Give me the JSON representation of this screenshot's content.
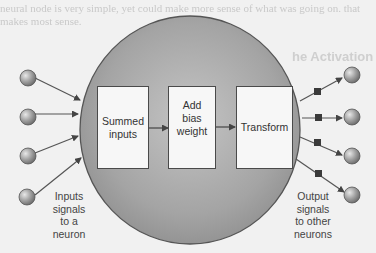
{
  "background_text": {
    "line1": "neural node is very simple, yet could make more sense of what was going on. that",
    "line2": "makes most sense.",
    "heading": "he Activation"
  },
  "neuron": {
    "fill_color": "#a6a6a6",
    "stroke_color": "#555555",
    "stages": [
      {
        "id": "summed",
        "lines": [
          "Summed",
          "inputs"
        ]
      },
      {
        "id": "bias",
        "lines": [
          "Add",
          "bias",
          "weight"
        ]
      },
      {
        "id": "transform",
        "lines": [
          "Transform"
        ]
      }
    ]
  },
  "inputs": {
    "count": 4,
    "caption_lines": [
      "Inputs",
      "signals",
      "to a",
      "neuron"
    ]
  },
  "outputs": {
    "count": 4,
    "caption_lines": [
      "Output",
      "signals",
      "to other",
      "neurons"
    ]
  },
  "colors": {
    "node_fill": "#9a9a9a",
    "arrow": "#555555",
    "weight_square": "#3a3a3a"
  }
}
